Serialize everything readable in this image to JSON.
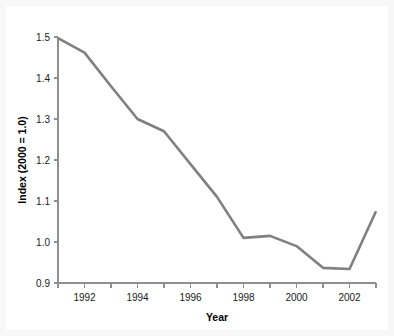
{
  "chart_data": {
    "type": "line",
    "title": "",
    "xlabel": "Year",
    "ylabel": "Index (2000 = 1.0)",
    "x": [
      1991,
      1992,
      1993,
      1994,
      1995,
      1996,
      1997,
      1998,
      1999,
      2000,
      2001,
      2002,
      2003
    ],
    "values": [
      1.497,
      1.462,
      1.38,
      1.3,
      1.27,
      1.19,
      1.11,
      1.01,
      1.015,
      0.99,
      0.937,
      0.934,
      1.075
    ],
    "series": [
      {
        "name": "Index (2000 = 1.0)",
        "color": "#808080",
        "values": [
          1.497,
          1.462,
          1.38,
          1.3,
          1.27,
          1.19,
          1.11,
          1.01,
          1.015,
          0.99,
          0.937,
          0.934,
          1.075
        ]
      }
    ],
    "xlim": [
      1991,
      2003
    ],
    "ylim": [
      0.9,
      1.5
    ],
    "xticks": [
      1991,
      1992,
      1993,
      1994,
      1995,
      1996,
      1997,
      1998,
      1999,
      2000,
      2001,
      2002,
      2003
    ],
    "xtick_labels": [
      "",
      "1992",
      "",
      "1994",
      "",
      "1996",
      "",
      "1998",
      "",
      "2000",
      "",
      "2002",
      ""
    ],
    "yticks": [
      0.9,
      1.0,
      1.1,
      1.2,
      1.3,
      1.4,
      1.5
    ],
    "ytick_labels": [
      "0.9",
      "1.0",
      "1.1",
      "1.2",
      "1.3",
      "1.4",
      "1.5"
    ],
    "grid": false,
    "legend": false,
    "legend_position": "none"
  },
  "style": {
    "background": "#ffffff",
    "page_background": "#f2f2f2",
    "line_color": "#808080",
    "axis_color": "#8f8f8f",
    "text_color": "#1a1a1a"
  }
}
